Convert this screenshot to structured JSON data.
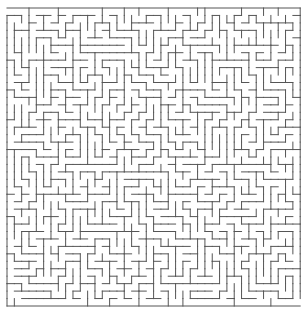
{
  "maze": {
    "cols": 40,
    "rows": 40,
    "origin_x": 7,
    "origin_y": 8,
    "cell_w": 7.33,
    "cell_h": 7.45,
    "wall_color": "#555555",
    "wall_width": 1,
    "background": "#ffffff",
    "seed": 1337,
    "entrance": {
      "side": "left",
      "row": 0
    },
    "exit": {
      "side": "right",
      "row": 39
    }
  }
}
